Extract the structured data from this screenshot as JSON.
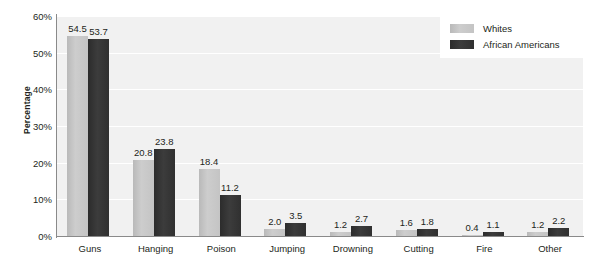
{
  "chart_data": {
    "type": "bar",
    "title": "",
    "subtitle": "",
    "xlabel": "",
    "ylabel": "Percentage",
    "categories": [
      "Guns",
      "Hanging",
      "Poison",
      "Jumping",
      "Drowning",
      "Cutting",
      "Fire",
      "Other"
    ],
    "series": [
      {
        "name": "Whites",
        "color": "#c4c4c4",
        "values": [
          54.5,
          20.8,
          18.4,
          2.0,
          1.2,
          1.6,
          0.4,
          1.2
        ],
        "labels": [
          "54.5",
          "20.8",
          "18.4",
          "2.0",
          "1.2",
          "1.6",
          "0.4",
          "1.2"
        ]
      },
      {
        "name": "African Americans",
        "color": "#333333",
        "values": [
          53.7,
          23.8,
          11.2,
          3.5,
          2.7,
          1.8,
          1.1,
          2.2
        ],
        "labels": [
          "53.7",
          "23.8",
          "11.2",
          "3.5",
          "2.7",
          "1.8",
          "1.1",
          "2.2"
        ]
      }
    ],
    "ylim": [
      0,
      60
    ],
    "y_ticks": [
      0,
      10,
      20,
      30,
      40,
      50,
      60
    ],
    "y_tick_labels": [
      "0%",
      "10%",
      "20%",
      "30%",
      "40%",
      "50%",
      "60%"
    ],
    "grid": true,
    "grid_color": "#ffffff",
    "plot_background": "#f1f1f1",
    "figure_background": "#ffffff",
    "axis_color": "#8a8a8a",
    "legend_position": "top-right",
    "data_labels": true
  },
  "legend": {
    "items": [
      {
        "label": "Whites"
      },
      {
        "label": "African Americans"
      }
    ]
  }
}
